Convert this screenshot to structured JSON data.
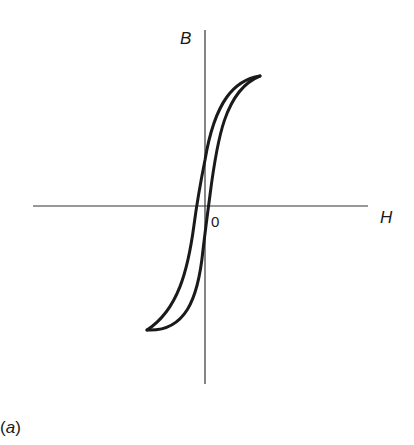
{
  "figure": {
    "caption_open": "(",
    "caption_letter": "a",
    "caption_close": ")",
    "x_axis_label": "H",
    "y_axis_label": "B",
    "origin_label": "0",
    "stroke_color": "#1a1a1a",
    "axis_color": "#333333"
  }
}
